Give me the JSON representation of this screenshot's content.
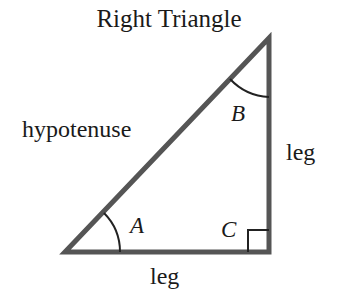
{
  "title": "Right Triangle",
  "labels": {
    "hypotenuse": "hypotenuse",
    "leg_vertical": "leg",
    "leg_horizontal": "leg"
  },
  "angles": {
    "A": "A",
    "B": "B",
    "C": "C"
  },
  "colors": {
    "stroke": "#555555",
    "text": "#1a1a1a",
    "background": "#ffffff"
  }
}
